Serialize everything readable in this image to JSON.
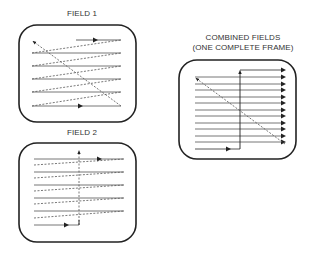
{
  "panels": {
    "field1": {
      "label": "FIELD 1"
    },
    "field2": {
      "label": "FIELD 2"
    },
    "combined": {
      "label_line1": "COMBINED FIELDS",
      "label_line2": "(ONE COMPLETE FRAME)"
    }
  },
  "colors": {
    "stroke": "#222222",
    "text": "#333333",
    "background": "#ffffff"
  },
  "legend": {
    "solid_line": "active scan line",
    "dashed_line": "retrace"
  }
}
